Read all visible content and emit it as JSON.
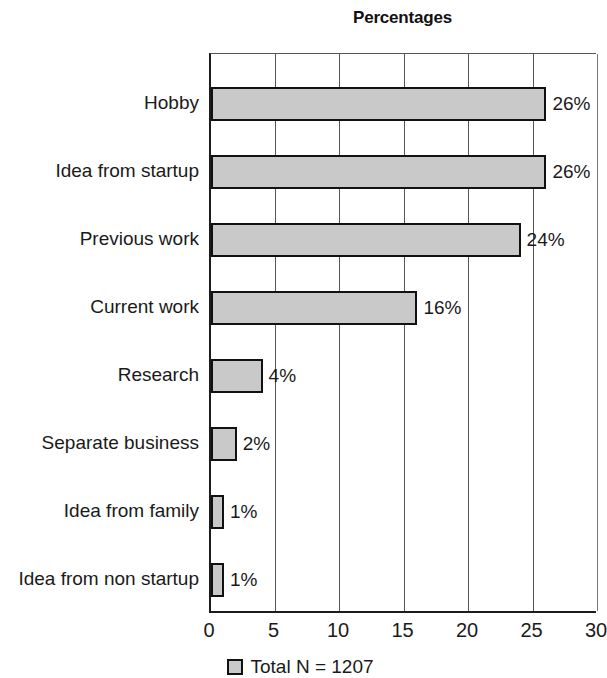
{
  "chart_data": {
    "type": "bar",
    "orientation": "horizontal",
    "title": "Percentages",
    "xlabel": "",
    "ylabel": "",
    "xlim": [
      0,
      30
    ],
    "xticks": [
      "0",
      "5",
      "10",
      "15",
      "20",
      "25",
      "30"
    ],
    "grid": true,
    "legend_position": "bottom",
    "legend": [
      "Total N = 1207"
    ],
    "categories": [
      "Hobby",
      "Idea from startup",
      "Previous work",
      "Current work",
      "Research",
      "Separate business",
      "Idea from family",
      "Idea from non startup"
    ],
    "values": [
      26,
      26,
      24,
      16,
      4,
      2,
      1,
      1
    ],
    "value_labels": [
      "26%",
      "26%",
      "24%",
      "16%",
      "4%",
      "2%",
      "1%",
      "1%"
    ],
    "colors": {
      "bar_fill": "#c9c9c9",
      "bar_border": "#111111",
      "axis": "#1c1c1c",
      "grid": "#555555",
      "text": "#1a1a1a",
      "background": "#ffffff"
    }
  },
  "legend": {
    "swatch_label": "legend-swatch",
    "text": "Total N = 1207"
  }
}
